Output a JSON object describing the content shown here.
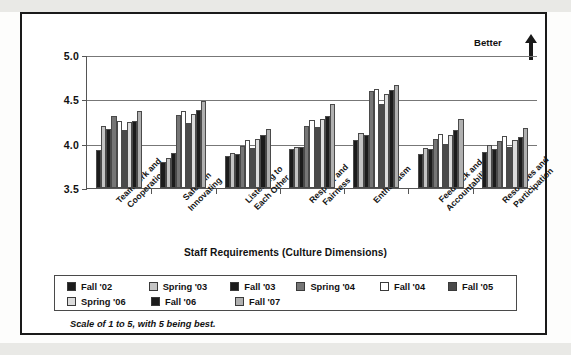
{
  "chart_data": {
    "type": "bar",
    "title": "",
    "xlabel": "Staff Requirements (Culture Dimensions)",
    "ylabel": "",
    "ylim": [
      3.5,
      5.0
    ],
    "yticks": [
      "3.5",
      "4.0",
      "4.5",
      "5.0"
    ],
    "ytick_values": [
      3.5,
      4.0,
      4.5,
      5.0
    ],
    "grid": true,
    "legend_position": "bottom",
    "annotation": "Better",
    "footnote": "Scale of 1 to 5, with 5 being best.",
    "categories": [
      "Teamwork and Cooperation",
      "Safety in Innovating",
      "Listening to Each Other",
      "Respect and Fairness",
      "Enthusiasm",
      "Feedback and Accountability",
      "Resources and Participation"
    ],
    "categories_lines": [
      [
        "Teamwork and",
        "Cooperation"
      ],
      [
        "Safety in",
        "Innovating"
      ],
      [
        "Listening to",
        "Each Other"
      ],
      [
        "Respect and",
        "Fairness"
      ],
      [
        "Enthusiasm"
      ],
      [
        "Feedback and",
        "Accountability"
      ],
      [
        "Resources and",
        "Participation"
      ]
    ],
    "series": [
      {
        "name": "Fall '02",
        "color": "#1c1c1c",
        "values": [
          3.93,
          3.79,
          3.86,
          3.94,
          4.04,
          3.88,
          3.91
        ]
      },
      {
        "name": "Spring '03",
        "color": "#c4c4c4",
        "values": [
          4.2,
          3.84,
          3.9,
          3.96,
          4.12,
          3.95,
          3.98
        ]
      },
      {
        "name": "Fall '03",
        "color": "#1c1c1c",
        "values": [
          4.17,
          3.89,
          3.88,
          3.96,
          4.1,
          3.94,
          3.94
        ]
      },
      {
        "name": "Spring '04",
        "color": "#767676",
        "values": [
          4.31,
          4.32,
          3.97,
          4.2,
          4.59,
          4.05,
          4.03
        ]
      },
      {
        "name": "Fall '04",
        "color": "#ffffff",
        "values": [
          4.26,
          4.37,
          4.04,
          4.27,
          4.62,
          4.11,
          4.09
        ]
      },
      {
        "name": "Fall '05",
        "color": "#4a4a4a",
        "values": [
          4.15,
          4.23,
          3.95,
          4.19,
          4.45,
          4.0,
          3.96
        ]
      },
      {
        "name": "Spring '06",
        "color": "#dcdcdc",
        "values": [
          4.24,
          4.33,
          4.05,
          4.28,
          4.56,
          4.1,
          4.04
        ]
      },
      {
        "name": "Fall '06",
        "color": "#1c1c1c",
        "values": [
          4.26,
          4.38,
          4.1,
          4.31,
          4.6,
          4.15,
          4.08
        ]
      },
      {
        "name": "Fall '07",
        "color": "#b0b0b0",
        "values": [
          4.37,
          4.48,
          4.16,
          4.45,
          4.66,
          4.28,
          4.18
        ]
      }
    ]
  },
  "legend": {
    "rows": [
      [
        {
          "label": "Fall '02",
          "color": "#1c1c1c"
        },
        {
          "label": "Spring '03",
          "color": "#c4c4c4"
        },
        {
          "label": "Fall '03",
          "color": "#1c1c1c"
        },
        {
          "label": "Spring '04",
          "color": "#767676"
        },
        {
          "label": "Fall '04",
          "color": "#ffffff"
        },
        {
          "label": "Fall '05",
          "color": "#4a4a4a"
        }
      ],
      [
        {
          "label": "Spring '06",
          "color": "#dcdcdc"
        },
        {
          "label": "Fall '06",
          "color": "#1c1c1c"
        },
        {
          "label": "Fall '07",
          "color": "#b0b0b0"
        }
      ]
    ]
  }
}
